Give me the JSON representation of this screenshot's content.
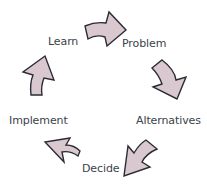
{
  "diagram": {
    "type": "cycle",
    "colors": {
      "arrow_fill": "#d9c9ce",
      "arrow_stroke": "#2b2b36",
      "text": "#3b424a",
      "background": "#ffffff"
    },
    "steps": [
      {
        "id": "learn",
        "label": "Learn"
      },
      {
        "id": "problem",
        "label": "Problem"
      },
      {
        "id": "alternatives",
        "label": "Alternatives"
      },
      {
        "id": "decide",
        "label": "Decide"
      },
      {
        "id": "implement",
        "label": "Implement"
      }
    ],
    "arrows": [
      {
        "from": "Learn",
        "to": "Problem",
        "direction": "right"
      },
      {
        "from": "Problem",
        "to": "Alternatives",
        "direction": "down"
      },
      {
        "from": "Alternatives",
        "to": "Decide",
        "direction": "down-left"
      },
      {
        "from": "Decide",
        "to": "Implement",
        "direction": "up-left"
      },
      {
        "from": "Implement",
        "to": "Learn",
        "direction": "up"
      }
    ]
  }
}
